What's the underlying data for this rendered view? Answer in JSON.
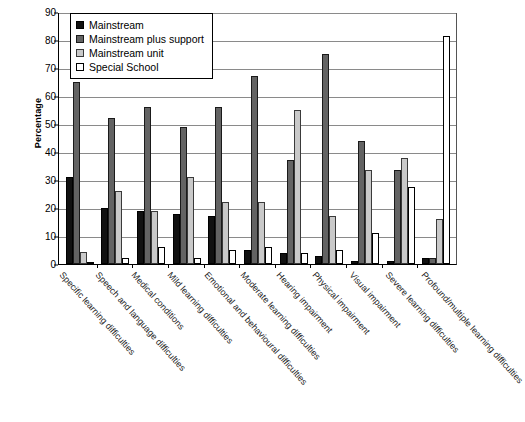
{
  "chart_data": {
    "type": "bar",
    "title": "",
    "xlabel": "",
    "ylabel": "Percentage",
    "ylim": [
      0,
      90
    ],
    "ytick_step": 10,
    "yticks": [
      0,
      10,
      20,
      30,
      40,
      50,
      60,
      70,
      80,
      90
    ],
    "grid": true,
    "legend_position": "top-left",
    "categories": [
      "Specific learning difficulties",
      "Speech and language difficulties",
      "Medical conditions",
      "Mild learning difficulties",
      "Emotional and behavioural difficulties",
      "Moderate learning difficulties",
      "Hearing impairment",
      "Physical impairment",
      "Visual impairment",
      "Severe learning difficulties",
      "Profound/multiple learning difficulties"
    ],
    "series": [
      {
        "name": "Mainstream",
        "color": "#111111",
        "values": [
          31,
          20,
          19,
          18,
          17,
          5,
          4,
          3,
          1,
          1,
          2
        ]
      },
      {
        "name": "Mainstream plus support",
        "color": "#636363",
        "values": [
          65,
          52,
          56,
          49,
          56,
          67,
          37,
          75,
          44,
          33.5,
          2
        ]
      },
      {
        "name": "Mainstream unit",
        "color": "#c9c9c9",
        "values": [
          4.3,
          26,
          19,
          31,
          22,
          22,
          55,
          17,
          33.5,
          38,
          16
        ]
      },
      {
        "name": "Special School",
        "color": "#ffffff",
        "values": [
          0,
          2.2,
          6,
          2.2,
          5,
          6,
          4,
          5,
          11,
          27.5,
          81.5
        ]
      }
    ]
  },
  "legend": {
    "items": [
      {
        "label": "Mainstream"
      },
      {
        "label": "Mainstream plus support"
      },
      {
        "label": "Mainstream unit"
      },
      {
        "label": "Special School"
      }
    ]
  }
}
